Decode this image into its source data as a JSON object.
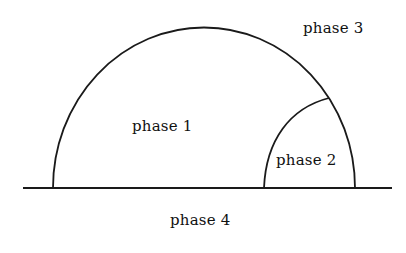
{
  "diagram": {
    "type": "phase-diagram",
    "colors": {
      "stroke": "#1a1a1a",
      "background": "#ffffff",
      "text": "#111111"
    },
    "labels": {
      "phase1": "phase 1",
      "phase2": "phase 2",
      "phase3": "phase 3",
      "phase4": "phase 4"
    }
  }
}
